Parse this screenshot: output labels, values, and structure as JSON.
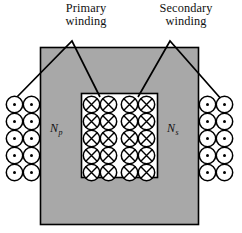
{
  "figure": {
    "type": "transformer-cross-section-diagram",
    "background": "#ffffff",
    "core": {
      "fill": "#a8a8a8",
      "stroke": "#000000",
      "outer": {
        "x": 40,
        "y": 47,
        "w": 158,
        "h": 177
      },
      "window": {
        "x": 81,
        "y": 93,
        "w": 76,
        "h": 84,
        "fill": "#ffffff"
      }
    },
    "labels": {
      "primary_line1": "Primary",
      "primary_line2": "winding",
      "secondary_line1": "Secondary",
      "secondary_line2": "winding",
      "primary_turns": "N",
      "primary_turns_sub": "p",
      "secondary_turns": "N",
      "secondary_turns_sub": "s"
    },
    "leaders": [
      {
        "name": "primary-leader",
        "apex": [
          72,
          41
        ],
        "left_end": [
          14,
          100
        ],
        "right_end": [
          100,
          97
        ]
      },
      {
        "name": "secondary-leader",
        "apex": [
          170,
          41
        ],
        "left_end": [
          138,
          97
        ],
        "right_end": [
          222,
          100
        ]
      }
    ],
    "coils": [
      {
        "name": "primary-outer-coil",
        "symbol": "dot",
        "cols": 2,
        "rows": 5,
        "x": 6,
        "y": 96,
        "cell": 17,
        "fill": "#ffffff",
        "stroke": "#000000"
      },
      {
        "name": "primary-inner-coil",
        "symbol": "cross",
        "cols": 2,
        "rows": 5,
        "x": 83,
        "y": 96,
        "cell": 17,
        "fill": "#ffffff",
        "stroke": "#000000"
      },
      {
        "name": "secondary-inner-coil",
        "symbol": "cross",
        "cols": 2,
        "rows": 5,
        "x": 121,
        "y": 96,
        "cell": 17,
        "fill": "#ffffff",
        "stroke": "#000000"
      },
      {
        "name": "secondary-outer-coil",
        "symbol": "dot",
        "cols": 2,
        "rows": 5,
        "x": 199,
        "y": 96,
        "cell": 17,
        "fill": "#ffffff",
        "stroke": "#000000"
      }
    ],
    "turn_label_positions": {
      "primary": [
        50,
        132
      ],
      "secondary": [
        167,
        132
      ]
    }
  }
}
